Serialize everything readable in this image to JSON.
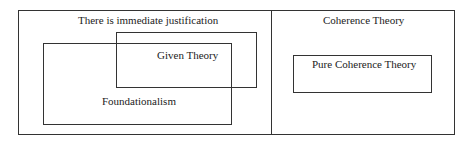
{
  "diagram": {
    "left_region": {
      "label": "There is immediate justification"
    },
    "given_theory": {
      "label": "Given Theory"
    },
    "foundationalism": {
      "label": "Foundationalism"
    },
    "right_region": {
      "label": "Coherence Theory"
    },
    "pure_coherence": {
      "label": "Pure Coherence Theory"
    }
  }
}
